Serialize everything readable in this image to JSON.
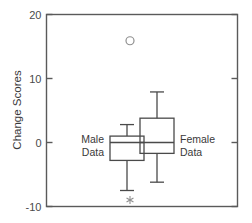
{
  "chart_data": {
    "type": "box",
    "title": "",
    "xlabel": "",
    "ylabel": "Change Scores",
    "ylim": [
      -10,
      20
    ],
    "yticks": [
      -10,
      0,
      10,
      20
    ],
    "ytick_labels": [
      "-10",
      "0",
      "10",
      "20"
    ],
    "xticks": [],
    "xtick_labels": [],
    "grid": false,
    "legend": "none",
    "categories": [
      "Male Data",
      "Female Data"
    ],
    "series": [
      {
        "name": "Male Data",
        "label": "Male Data",
        "label_line1": "Male",
        "label_line2": "Data",
        "whisker_low": -7.5,
        "q1": -2.8,
        "median": 0.0,
        "q3": 1.0,
        "whisker_high": 2.8,
        "outliers": [
          {
            "value": 15.9,
            "marker": "circle"
          },
          {
            "value": -9.0,
            "marker": "asterisk"
          }
        ]
      },
      {
        "name": "Female Data",
        "label": "Female Data",
        "label_line1": "Female",
        "label_line2": "Data",
        "whisker_low": -6.2,
        "q1": -1.7,
        "median": 0.0,
        "q3": 3.8,
        "whisker_high": 7.9,
        "outliers": []
      }
    ]
  },
  "colors": {
    "axis": "#5a5a5a",
    "box": "#4a4a4a",
    "outlier": "#8f8f8f",
    "text": "#3a3a3a",
    "background": "#ffffff"
  }
}
